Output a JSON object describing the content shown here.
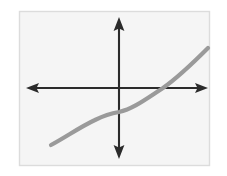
{
  "figure": {
    "background_color": "#ffffff",
    "panel_color": "#f5f5f5",
    "border_color": "#dcdcdc",
    "axis_color": "#2b2b2b",
    "curve_color": "#9a9a9a",
    "frame": {
      "x": 19,
      "y": 11,
      "width": 191,
      "height": 155
    }
  },
  "axes": {
    "origin": {
      "x": 119,
      "y": 88
    },
    "x_axis": {
      "label": "",
      "from_x": 26,
      "to_x": 208,
      "y": 88,
      "arrow_left": true,
      "arrow_right": true
    },
    "y_axis": {
      "label": "",
      "x": 119,
      "from_y": 17,
      "to_y": 159,
      "arrow_up": true,
      "arrow_down": true
    },
    "tick_labels_x": [],
    "tick_labels_y": [],
    "grid": false
  },
  "chart_data": {
    "type": "line",
    "title": "",
    "subtitle": "",
    "xlabel": "",
    "ylabel": "",
    "xlim": [
      -3.1,
      3.05
    ],
    "ylim": [
      -2.2,
      2.2
    ],
    "grid": false,
    "legend": [],
    "legend_position": "none",
    "annotations": [],
    "series": [
      {
        "name": "y = x³ (scaled)",
        "color": "#9a9a9a",
        "line_width": 4.2,
        "x": [
          -2.3,
          -2.0,
          -1.7,
          -1.4,
          -1.1,
          -0.8,
          -0.5,
          -0.2,
          0.0,
          0.3,
          0.6,
          0.9,
          1.2,
          1.5,
          1.8,
          2.1,
          2.4,
          2.7,
          3.0
        ],
        "y": [
          -1.61,
          -1.48,
          -1.33,
          -1.16,
          -0.97,
          -0.76,
          -0.53,
          -0.28,
          -0.14,
          0.08,
          0.22,
          0.36,
          0.49,
          0.63,
          0.79,
          0.98,
          1.2,
          1.46,
          1.76
        ]
      }
    ],
    "x_intercepts": [
      1.16
    ],
    "y_intercepts": [
      -0.14
    ],
    "pixel_path": "M 51 145 C 66 137, 80 127, 95 120 C 107 114, 113 113, 119 112 C 133 109, 146 99, 163 88 C 180 76, 194 62, 208 48"
  }
}
